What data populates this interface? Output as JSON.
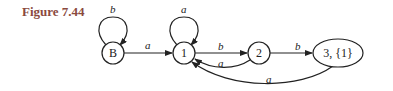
{
  "figure": {
    "caption": "Figure 7.44",
    "caption_color": "#8a4a3e"
  },
  "diagram": {
    "type": "state-transition-graph",
    "nodes": [
      {
        "id": "B",
        "label": "B"
      },
      {
        "id": "1",
        "label": "1"
      },
      {
        "id": "2",
        "label": "2"
      },
      {
        "id": "3",
        "label": "3, {1}"
      }
    ],
    "edges": [
      {
        "from": "B",
        "to": "B",
        "label": "b"
      },
      {
        "from": "B",
        "to": "1",
        "label": "a"
      },
      {
        "from": "1",
        "to": "1",
        "label": "a"
      },
      {
        "from": "1",
        "to": "2",
        "label": "b"
      },
      {
        "from": "2",
        "to": "1",
        "label": "a"
      },
      {
        "from": "2",
        "to": "3",
        "label": "b"
      },
      {
        "from": "3",
        "to": "1",
        "label": "a"
      }
    ]
  }
}
